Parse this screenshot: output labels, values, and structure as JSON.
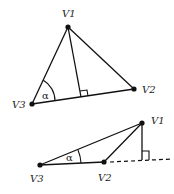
{
  "diagram": {
    "colors": {
      "stroke": "#111111",
      "text": "#222222",
      "background": "#ffffff"
    },
    "figure_top": {
      "title": "acute triangle with altitude inside",
      "vertices": {
        "V1": {
          "label": "V1",
          "x": 68,
          "y": 27
        },
        "V2": {
          "label": "V2",
          "x": 134,
          "y": 89
        },
        "V3": {
          "label": "V3",
          "x": 32,
          "y": 104
        }
      },
      "angle_label": "α",
      "altitude_foot": {
        "x": 81,
        "y": 97
      }
    },
    "figure_bottom": {
      "title": "obtuse triangle with altitude outside on extended base",
      "vertices": {
        "V1": {
          "label": "V1",
          "x": 142,
          "y": 123
        },
        "V2": {
          "label": "V2",
          "x": 104,
          "y": 162
        },
        "V3": {
          "label": "V3",
          "x": 40,
          "y": 165
        }
      },
      "angle_label": "α",
      "altitude_foot": {
        "x": 142,
        "y": 160
      },
      "extension": "dashed"
    }
  }
}
